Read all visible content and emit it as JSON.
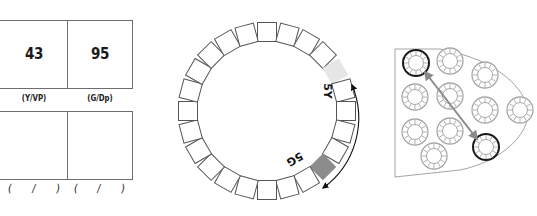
{
  "table_panel": {
    "top_row": [
      {
        "value": "43",
        "unit": "(Y/VP)"
      },
      {
        "value": "95",
        "unit": "(G/Dp)"
      }
    ],
    "bottom_row_placeholders": [
      {
        "open": "(",
        "sep": "/",
        "close": ")"
      },
      {
        "open": "(",
        "sep": "/",
        "close": ")"
      }
    ]
  },
  "hue_ring": {
    "square_count": 24,
    "highlights": [
      {
        "label": "5Y",
        "color": "#e6e6e6",
        "index": 4
      },
      {
        "label": "5G",
        "color": "#8c8c8c",
        "index": 9
      }
    ],
    "square_stroke": "#555555",
    "arrow": "curved double-headed arrow between 5Y and 5G"
  },
  "circle_array": {
    "circles": [
      {
        "x": 416,
        "y": 63,
        "selected": true
      },
      {
        "x": 450,
        "y": 61,
        "selected": false
      },
      {
        "x": 485,
        "y": 75,
        "selected": false
      },
      {
        "x": 415,
        "y": 97,
        "selected": false
      },
      {
        "x": 450,
        "y": 96,
        "selected": false
      },
      {
        "x": 485,
        "y": 110,
        "selected": false
      },
      {
        "x": 520,
        "y": 110,
        "selected": false
      },
      {
        "x": 415,
        "y": 132,
        "selected": false
      },
      {
        "x": 450,
        "y": 131,
        "selected": false
      },
      {
        "x": 434,
        "y": 156,
        "selected": false
      },
      {
        "x": 486,
        "y": 147,
        "selected": true
      }
    ],
    "selected_color": "#1a1a1a",
    "unselected_color": "#a8a8a8",
    "arrow_color": "#8a8a8a"
  }
}
